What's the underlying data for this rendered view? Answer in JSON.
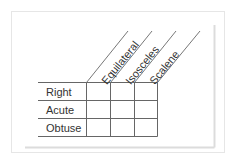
{
  "diagram": {
    "type": "classification-grid",
    "column_headers": [
      "Equilateral",
      "Isosceles",
      "Scalene"
    ],
    "row_headers": [
      "Right",
      "Acute",
      "Obtuse"
    ],
    "cells": [
      [
        "",
        "",
        ""
      ],
      [
        "",
        "",
        ""
      ],
      [
        "",
        "",
        ""
      ]
    ],
    "colors": {
      "grid_line": "#666666",
      "text": "#333333",
      "frame": "#e6e6e6",
      "shadow": "#dddddd",
      "background": "#ffffff"
    }
  }
}
